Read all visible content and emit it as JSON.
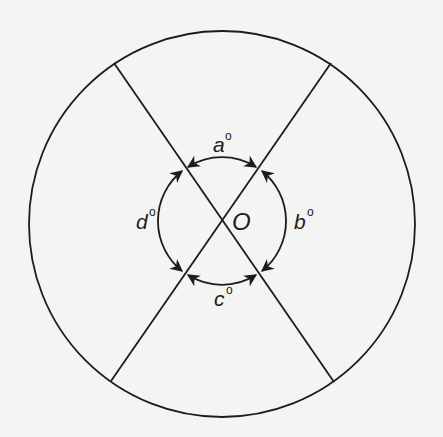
{
  "diagram": {
    "type": "geometry",
    "stroke_color": "#1c1c1c",
    "background": "#f4f4f2",
    "outer_circle": {
      "cx": 222,
      "cy": 224,
      "r": 193
    },
    "inner_circle": {
      "cx": 222,
      "cy": 221,
      "r": 64
    },
    "center": {
      "label": "O",
      "x": 222,
      "y": 221
    },
    "lines": [
      {
        "name": "line-nw-se",
        "x1": 114,
        "y1": 63,
        "x2": 334,
        "y2": 382
      },
      {
        "name": "line-ne-sw",
        "x1": 331,
        "y1": 63,
        "x2": 111,
        "y2": 381
      }
    ],
    "angles": [
      {
        "id": "a",
        "letter": "a",
        "degree": "o",
        "position": "top"
      },
      {
        "id": "b",
        "letter": "b",
        "degree": "o",
        "position": "right"
      },
      {
        "id": "c",
        "letter": "c",
        "degree": "o",
        "position": "bottom"
      },
      {
        "id": "d",
        "letter": "d",
        "degree": "o",
        "position": "left"
      }
    ]
  }
}
